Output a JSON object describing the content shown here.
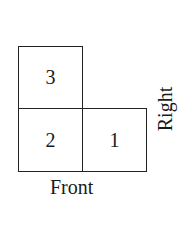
{
  "diagram": {
    "cells": [
      {
        "label": "3",
        "row": 0,
        "col": 0
      },
      {
        "label": "2",
        "row": 1,
        "col": 0
      },
      {
        "label": "1",
        "row": 1,
        "col": 1
      }
    ],
    "labels": {
      "front": "Front",
      "right": "Right"
    }
  }
}
